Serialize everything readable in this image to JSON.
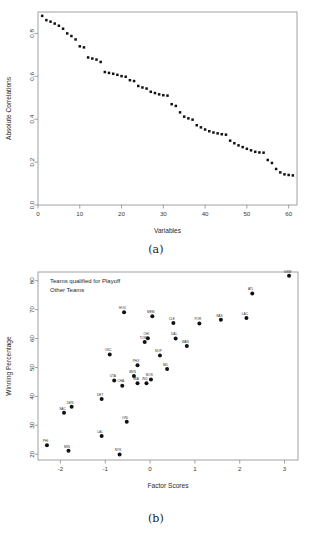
{
  "figure": {
    "caption_a": "(a)",
    "caption_b": "(b)"
  },
  "chart_data": [
    {
      "id": "panel-a",
      "type": "scatter",
      "title": "",
      "xlabel": "Variables",
      "ylabel": "Absolute Correlations",
      "xlim": [
        0,
        62
      ],
      "ylim": [
        0.0,
        0.9
      ],
      "xticks": [
        0,
        10,
        20,
        30,
        40,
        50,
        60
      ],
      "yticks": [
        0.0,
        0.2,
        0.4,
        0.6,
        0.8
      ],
      "xticklabels": [
        "0",
        "10",
        "20",
        "30",
        "40",
        "50",
        "60"
      ],
      "yticklabels": [
        "0.0",
        "0.2",
        "0.4",
        "0.6",
        "0.8"
      ],
      "grid": false,
      "legend": "none",
      "marker": "filled-square",
      "x": [
        1,
        2,
        3,
        4,
        5,
        6,
        7,
        8,
        9,
        10,
        11,
        12,
        13,
        14,
        15,
        16,
        17,
        18,
        19,
        20,
        21,
        22,
        23,
        24,
        25,
        26,
        27,
        28,
        29,
        30,
        31,
        32,
        33,
        34,
        35,
        36,
        37,
        38,
        39,
        40,
        41,
        42,
        43,
        44,
        45,
        46,
        47,
        48,
        49,
        50,
        51,
        52,
        53,
        54,
        55,
        56,
        57,
        58,
        59,
        60,
        61
      ],
      "y": [
        0.882,
        0.862,
        0.855,
        0.846,
        0.836,
        0.822,
        0.8,
        0.788,
        0.772,
        0.74,
        0.735,
        0.688,
        0.683,
        0.678,
        0.667,
        0.62,
        0.616,
        0.612,
        0.607,
        0.601,
        0.598,
        0.582,
        0.578,
        0.555,
        0.548,
        0.543,
        0.528,
        0.522,
        0.516,
        0.512,
        0.51,
        0.47,
        0.462,
        0.432,
        0.412,
        0.404,
        0.398,
        0.372,
        0.362,
        0.352,
        0.344,
        0.338,
        0.334,
        0.33,
        0.328,
        0.3,
        0.288,
        0.278,
        0.27,
        0.262,
        0.255,
        0.248,
        0.245,
        0.244,
        0.21,
        0.196,
        0.168,
        0.152,
        0.143,
        0.14,
        0.138,
        0.136,
        0.134,
        0.132,
        0.12,
        0.106,
        0.09,
        0.072,
        0.056,
        0.04,
        0.024,
        0.01
      ],
      "annotations": [
        "labelled top-ranked variable names (illegible at this resolution)"
      ]
    },
    {
      "id": "panel-b",
      "type": "scatter",
      "title": "",
      "xlabel": "Factor Scores",
      "ylabel": "Winning Percentage",
      "xlim": [
        -2.5,
        3.3
      ],
      "ylim": [
        18,
        83
      ],
      "xticks": [
        -2,
        -1,
        0,
        1,
        2,
        3
      ],
      "yticks": [
        20,
        30,
        40,
        50,
        60,
        70,
        80
      ],
      "xticklabels": [
        "-2",
        "-1",
        "0",
        "1",
        "2",
        "3"
      ],
      "yticklabels": [
        "20",
        "30",
        "40",
        "50",
        "60",
        "70",
        "80"
      ],
      "grid": false,
      "marker": "filled-circle",
      "legend": {
        "position": "top-left",
        "entries": [
          {
            "label": "Teams qualified for Playoff"
          },
          {
            "label": "Other Teams"
          }
        ]
      },
      "points": [
        {
          "label": "GSW",
          "x": 3.1,
          "y": 81.7
        },
        {
          "label": "ATL",
          "x": 2.28,
          "y": 75.6
        },
        {
          "label": "LAC",
          "x": 2.15,
          "y": 67.1
        },
        {
          "label": "SAS",
          "x": 1.58,
          "y": 66.5
        },
        {
          "label": "POR",
          "x": 1.1,
          "y": 65.2
        },
        {
          "label": "CLE",
          "x": 0.52,
          "y": 65.4
        },
        {
          "label": "MEM",
          "x": 0.05,
          "y": 67.7
        },
        {
          "label": "HOU",
          "x": -0.58,
          "y": 69.1
        },
        {
          "label": "DAL",
          "x": 0.57,
          "y": 60.0
        },
        {
          "label": "WAS",
          "x": 0.82,
          "y": 57.4
        },
        {
          "label": "CHI",
          "x": -0.05,
          "y": 60.1
        },
        {
          "label": "TOR",
          "x": -0.12,
          "y": 58.8
        },
        {
          "label": "NOP",
          "x": 0.22,
          "y": 54.1
        },
        {
          "label": "OKC",
          "x": -0.9,
          "y": 54.5
        },
        {
          "label": "MIL",
          "x": 0.38,
          "y": 49.5
        },
        {
          "label": "PHX",
          "x": -0.28,
          "y": 50.8
        },
        {
          "label": "BKN",
          "x": -0.36,
          "y": 47.0
        },
        {
          "label": "BOS",
          "x": 0.02,
          "y": 45.8
        },
        {
          "label": "IND",
          "x": -0.08,
          "y": 44.5
        },
        {
          "label": "MIA",
          "x": -0.28,
          "y": 44.5
        },
        {
          "label": "UTA",
          "x": -0.8,
          "y": 45.5
        },
        {
          "label": "CHA",
          "x": -0.62,
          "y": 43.7
        },
        {
          "label": "DET",
          "x": -1.08,
          "y": 39.1
        },
        {
          "label": "DEN",
          "x": -1.75,
          "y": 36.4
        },
        {
          "label": "SAC",
          "x": -1.92,
          "y": 34.3
        },
        {
          "label": "ORL",
          "x": -0.52,
          "y": 31.2
        },
        {
          "label": "LAL",
          "x": -1.08,
          "y": 26.3
        },
        {
          "label": "PHI",
          "x": -2.3,
          "y": 23.1
        },
        {
          "label": "MIN",
          "x": -1.82,
          "y": 21.2
        },
        {
          "label": "NYK",
          "x": -0.68,
          "y": 19.9
        }
      ]
    }
  ]
}
